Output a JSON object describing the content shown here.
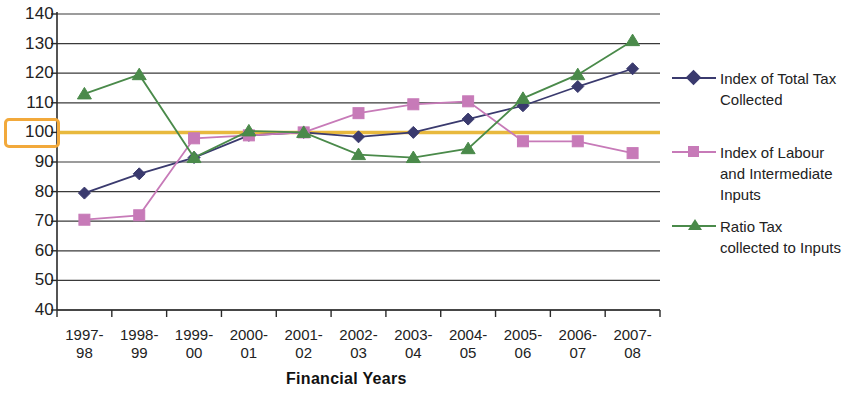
{
  "chart_data": {
    "type": "line",
    "title": "",
    "xlabel": "Financial Years",
    "ylabel": "",
    "categories": [
      "1997-\n98",
      "1998-\n99",
      "1999-\n00",
      "2000-\n01",
      "2001-\n02",
      "2002-\n03",
      "2003-\n04",
      "2004-\n05",
      "2005-\n06",
      "2006-\n07",
      "2007-\n08"
    ],
    "category_lines": [
      [
        "1997-",
        "98"
      ],
      [
        "1998-",
        "99"
      ],
      [
        "1999-",
        "00"
      ],
      [
        "2000-",
        "01"
      ],
      [
        "2001-",
        "02"
      ],
      [
        "2002-",
        "03"
      ],
      [
        "2003-",
        "04"
      ],
      [
        "2004-",
        "05"
      ],
      [
        "2005-",
        "06"
      ],
      [
        "2006-",
        "07"
      ],
      [
        "2007-",
        "08"
      ]
    ],
    "ylim": [
      40,
      140
    ],
    "ytick_values": [
      140,
      130,
      120,
      110,
      100,
      90,
      80,
      70,
      60,
      50,
      40
    ],
    "ytick_labels": [
      "140",
      "130",
      "120",
      "110",
      "100",
      "90",
      "80",
      "70",
      "60",
      "50",
      "40"
    ],
    "highlighted_ytick": "100",
    "grid": true,
    "legend_position": "right",
    "reference_line": {
      "value": 100,
      "color": "#e8b93e"
    },
    "series": [
      {
        "name": "Index of Total Tax Collected",
        "color": "#3a3a6e",
        "marker": "diamond",
        "values": [
          79.5,
          86,
          91.5,
          99,
          100,
          98.5,
          100,
          104.5,
          109,
          115.5,
          121.5
        ]
      },
      {
        "name": "Index of Labour and Intermediate Inputs",
        "color": "#c77ab8",
        "marker": "square",
        "values": [
          70.5,
          72,
          98,
          99,
          100,
          106.5,
          109.5,
          110.5,
          97,
          97,
          93
        ]
      },
      {
        "name": "Ratio Tax collected to Inputs",
        "color": "#4a8a4a",
        "marker": "triangle",
        "values": [
          113,
          119.5,
          91.5,
          100.5,
          100,
          92.5,
          91.5,
          94.5,
          111.5,
          119.5,
          131
        ]
      }
    ]
  },
  "legend": {
    "items": [
      {
        "label_line1": "Index of Total Tax",
        "label_line2": "Collected",
        "label_line3": ""
      },
      {
        "label_line1": "Index of Labour",
        "label_line2": "and Intermediate",
        "label_line3": "Inputs"
      },
      {
        "label_line1": "Ratio Tax",
        "label_line2": "collected to Inputs",
        "label_line3": ""
      }
    ]
  },
  "axis": {
    "x_title": "Financial Years"
  }
}
